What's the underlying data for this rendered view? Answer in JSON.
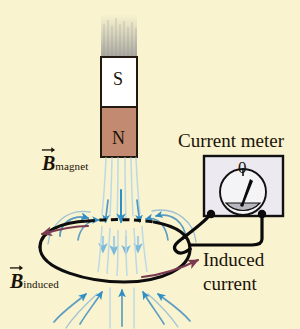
{
  "figure": {
    "kind": "physics-diagram",
    "topic": "electromagnetic-induction-lenz-law",
    "background_color": "#f9f3cf"
  },
  "magnet": {
    "south_pole_label": "S",
    "north_pole_label": "N",
    "south_fill": "#ffffff",
    "north_fill": "#c28a70",
    "outline_color": "#221a10",
    "motion_blur_color": "#9a9a9a"
  },
  "meter": {
    "title": "Current meter",
    "scale_zero_label": "0",
    "face_fill": "#eceaf0",
    "dial_fill": "#f4f3f6",
    "sector_fill": "#b9b7bf",
    "outline_color": "#111111",
    "terminal_color": "#0b0b0b"
  },
  "field": {
    "magnet_label_symbol": "B",
    "magnet_label_subscript": "magnet",
    "induced_label_symbol": "B",
    "induced_label_subscript": "induced",
    "line_color": "#4f97c4",
    "line_color_pale": "#a9cfe3",
    "arrow_color": "#2f8fc4"
  },
  "current": {
    "label_line1": "Induced",
    "label_line2": "current",
    "arrow_color": "#7a3a50",
    "loop_color": "#0d0d0d",
    "wire_color": "#0a0a0a"
  },
  "icons": {
    "vector-arrow-icon": "vector-arrow-icon",
    "meter-needle-icon": "meter-needle-icon",
    "field-arrow-icon": "field-arrow-icon",
    "current-arrow-icon": "current-arrow-icon"
  }
}
